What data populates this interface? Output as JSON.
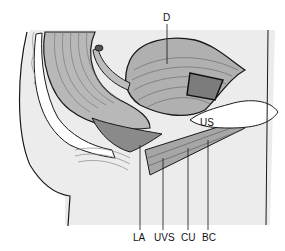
{
  "figure": {
    "type": "anatomical-diagram",
    "view": "sagittal section of pelvis",
    "labels": [
      {
        "id": "D",
        "text": "D",
        "x": 163,
        "y": 13
      },
      {
        "id": "US",
        "text": "US",
        "x": 200,
        "y": 118
      },
      {
        "id": "LA",
        "text": "LA",
        "x": 133,
        "y": 233
      },
      {
        "id": "UVS",
        "text": "UVS",
        "x": 154,
        "y": 233
      },
      {
        "id": "CU",
        "text": "CU",
        "x": 181,
        "y": 233
      },
      {
        "id": "BC",
        "text": "BC",
        "x": 202,
        "y": 233
      }
    ],
    "colors": {
      "background": "#ffffff",
      "tissue_light": "#e4e4e4",
      "tissue_mid": "#b8b8b8",
      "tissue_dark": "#8a8a8a",
      "outline": "#1a1a1a"
    }
  }
}
